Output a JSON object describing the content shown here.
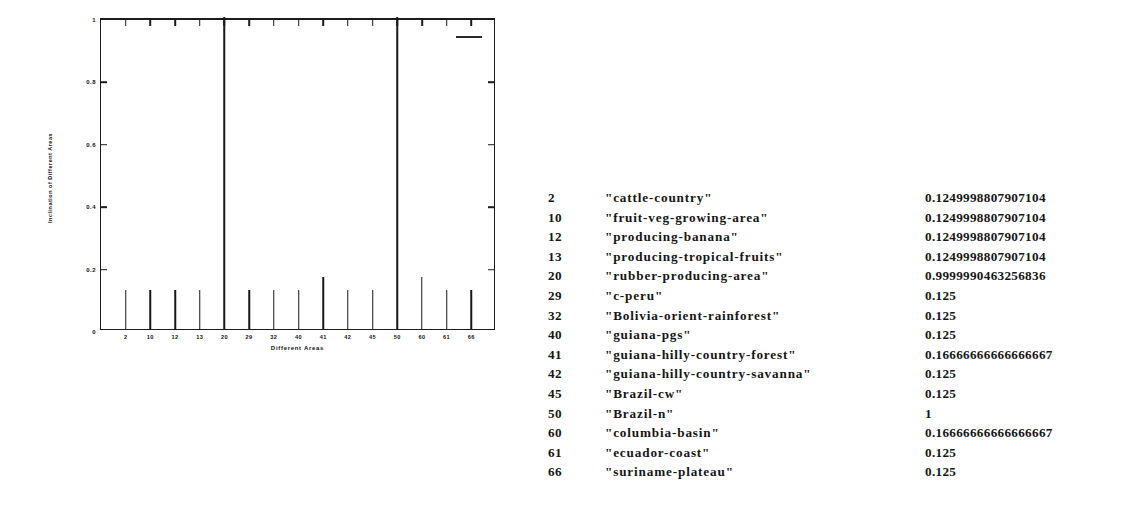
{
  "chart_data": {
    "type": "bar",
    "title": "",
    "xlabel": "Different Areas",
    "ylabel": "Inclination of Different Areas",
    "categories": [
      "2",
      "10",
      "12",
      "13",
      "20",
      "29",
      "32",
      "40",
      "41",
      "42",
      "45",
      "50",
      "60",
      "61",
      "66"
    ],
    "values": [
      0.1249998807907104,
      0.1249998807907104,
      0.1249998807907104,
      0.1249998807907104,
      0.9999990463256836,
      0.125,
      0.125,
      0.125,
      0.16666666666666666,
      0.125,
      0.125,
      1,
      0.16666666666666666,
      0.125,
      0.125
    ],
    "ylim": [
      0,
      1
    ],
    "yticks": [
      "0",
      "0.2",
      "0.4",
      "0.6",
      "0.8",
      "1"
    ],
    "ytick_values": [
      0,
      0.2,
      0.4,
      0.6,
      0.8,
      1
    ],
    "xtick_labels": [
      "2",
      "10",
      "12",
      "13",
      "20",
      "29",
      "32",
      "40",
      "41",
      "42",
      "45",
      "50",
      "60",
      "61",
      "66"
    ],
    "grid": false,
    "legend_position": "top-right",
    "legend_entries": [
      ""
    ]
  },
  "figure": {
    "ylabel": "Inclination of Different Areas",
    "xlabel": "Different Areas",
    "legend_marker": "line-marker"
  },
  "table": {
    "rows": [
      {
        "id": "2",
        "name": "\"cattle-country\"",
        "value": "0.1249998807907104"
      },
      {
        "id": "10",
        "name": "\"fruit-veg-growing-area\"",
        "value": "0.1249998807907104"
      },
      {
        "id": "12",
        "name": "\"producing-banana\"",
        "value": "0.1249998807907104"
      },
      {
        "id": "13",
        "name": "\"producing-tropical-fruits\"",
        "value": "0.1249998807907104"
      },
      {
        "id": "20",
        "name": "\"rubber-producing-area\"",
        "value": "0.9999990463256836"
      },
      {
        "id": "29",
        "name": "\"c-peru\"",
        "value": "0.125"
      },
      {
        "id": "32",
        "name": "\"Bolivia-orient-rainforest\"",
        "value": "0.125"
      },
      {
        "id": "40",
        "name": "\"guiana-pgs\"",
        "value": "0.125"
      },
      {
        "id": "41",
        "name": "\"guiana-hilly-country-forest\"",
        "value": "0.16666666666666667"
      },
      {
        "id": "42",
        "name": "\"guiana-hilly-country-savanna\"",
        "value": "0.125"
      },
      {
        "id": "45",
        "name": "\"Brazil-cw\"",
        "value": "0.125"
      },
      {
        "id": "50",
        "name": "\"Brazil-n\"",
        "value": "1"
      },
      {
        "id": "60",
        "name": "\"columbia-basin\"",
        "value": "0.16666666666666667"
      },
      {
        "id": "61",
        "name": "\"ecuador-coast\"",
        "value": "0.125"
      },
      {
        "id": "66",
        "name": "\"suriname-plateau\"",
        "value": "0.125"
      }
    ]
  }
}
